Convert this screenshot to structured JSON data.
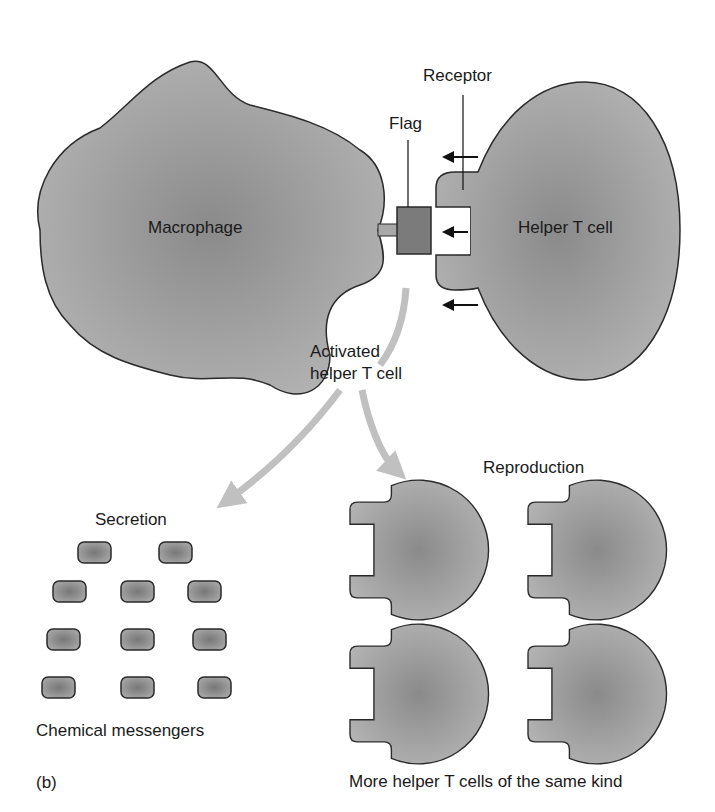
{
  "figure": {
    "panel_label": "(b)",
    "top": {
      "macrophage_label": "Macrophage",
      "helper_cell_label": "Helper T cell",
      "flag_label": "Flag",
      "receptor_label": "Receptor"
    },
    "middle": {
      "activated_line1": "Activated",
      "activated_line2": "helper T cell"
    },
    "left_branch": {
      "title": "Secretion",
      "caption": "Chemical messengers",
      "messenger_count": 11
    },
    "right_branch": {
      "title": "Reproduction",
      "caption": "More helper T cells of the same kind",
      "cell_count": 4
    },
    "colors": {
      "cell_fill": "#9a9a9a",
      "cell_fill_light": "#bdbdbd",
      "flag_fill": "#777777",
      "arrow_gray": "#bfbfbf",
      "outline": "#2a2a2a"
    }
  }
}
